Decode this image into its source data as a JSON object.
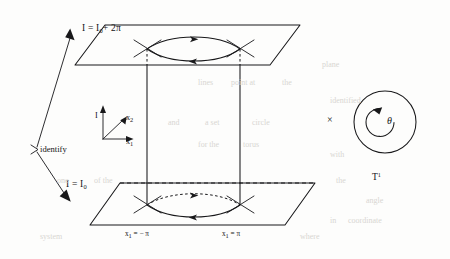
{
  "figure": {
    "name": "cylinder-identification-torus-diagram",
    "background_color": "#fdfdfc",
    "ink_color": "#18181a"
  },
  "labels": {
    "top_plane_level": "I = I",
    "top_plane_level_sub": "0",
    "top_plane_level_rest": "+ 2π",
    "bottom_plane_level": "I = I",
    "bottom_plane_level_sub": "0",
    "identify": "identify",
    "axis_I": "I",
    "axis_x2": "x",
    "axis_x2_sub": "2",
    "axis_x1": "x",
    "axis_x1_sub": "1",
    "left_section": "x",
    "left_section_sub": "1",
    "left_section_rest": "= − π",
    "right_section": "x",
    "right_section_sub": "1",
    "right_section_rest": "= π",
    "cross_symbol": "×",
    "theta": "θ",
    "torus_label": "T",
    "torus_label_sup": "1"
  },
  "geometry": {
    "top_plane": {
      "back_left": [
        105,
        25
      ],
      "back_right": [
        300,
        25
      ],
      "front_right": [
        270,
        65
      ],
      "front_left": [
        75,
        65
      ]
    },
    "bottom_plane": {
      "back_left": [
        120,
        183
      ],
      "back_right": [
        315,
        183
      ],
      "front_right": [
        285,
        225
      ],
      "front_left": [
        90,
        225
      ]
    },
    "left_vertical_x": 147,
    "right_vertical_x": 240,
    "top_lens_y": 49,
    "bottom_lens_y": 205,
    "circle": {
      "cx": 385,
      "cy": 122,
      "r_outer": 31,
      "r_inner": 14
    }
  },
  "ghost_text": {
    "items": [
      {
        "text": "lines",
        "x": 198,
        "y": 78
      },
      {
        "text": "point at",
        "x": 231,
        "y": 78
      },
      {
        "text": "the",
        "x": 282,
        "y": 78
      },
      {
        "text": "and",
        "x": 168,
        "y": 118
      },
      {
        "text": "a set",
        "x": 205,
        "y": 118
      },
      {
        "text": "circle",
        "x": 252,
        "y": 118
      },
      {
        "text": "for the",
        "x": 198,
        "y": 140
      },
      {
        "text": "torus",
        "x": 243,
        "y": 140
      },
      {
        "text": "one",
        "x": 57,
        "y": 176
      },
      {
        "text": "of the",
        "x": 94,
        "y": 176
      },
      {
        "text": "plane",
        "x": 322,
        "y": 60
      },
      {
        "text": "identified",
        "x": 330,
        "y": 96
      },
      {
        "text": "with",
        "x": 330,
        "y": 150
      },
      {
        "text": "the",
        "x": 336,
        "y": 176
      },
      {
        "text": "angle",
        "x": 366,
        "y": 196
      },
      {
        "text": "in",
        "x": 330,
        "y": 216
      },
      {
        "text": "coordinate",
        "x": 348,
        "y": 216
      },
      {
        "text": "system",
        "x": 40,
        "y": 232
      },
      {
        "text": "where",
        "x": 300,
        "y": 232
      }
    ]
  }
}
